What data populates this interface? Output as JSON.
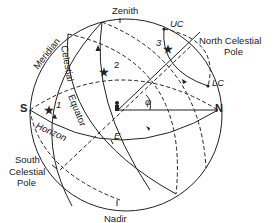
{
  "diagram": {
    "type": "celestial-sphere",
    "labels": {
      "zenith": "Zenith",
      "nadir": "Nadir",
      "north": "N",
      "south": "S",
      "east": "E",
      "meridian": "Meridian",
      "celestial_equator": "Celestial Equator",
      "celestial_equator_part1": "Celestial",
      "celestial_equator_part2": "Equator",
      "horizon": "Horizon",
      "north_celestial_pole_line1": "North Celestial",
      "north_celestial_pole_line2": "Pole",
      "south_celestial_pole_line1": "South",
      "south_celestial_pole_line2": "Celestial",
      "south_celestial_pole_line3": "Pole",
      "upper_culmination": "UC",
      "lower_culmination": "LC",
      "latitude_angle": "φ"
    },
    "stars": [
      {
        "id": "1",
        "label": "1"
      },
      {
        "id": "2",
        "label": "2"
      },
      {
        "id": "3",
        "label": "3"
      }
    ],
    "observer": "observer-figure"
  }
}
